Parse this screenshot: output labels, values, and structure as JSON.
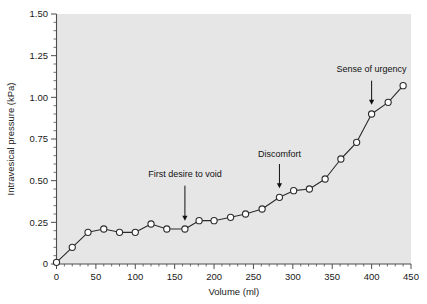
{
  "chart_data": {
    "type": "line",
    "title": "",
    "xlabel": "Volume (ml)",
    "ylabel": "Intravesical pressure (kPa)",
    "xlim": [
      0,
      450
    ],
    "ylim": [
      0,
      1.5
    ],
    "xticks": [
      0,
      50,
      100,
      150,
      200,
      250,
      300,
      350,
      400,
      450
    ],
    "xtick_labels": [
      "0",
      "50",
      "100",
      "150",
      "200",
      "250",
      "300",
      "350",
      "400",
      "450"
    ],
    "yticks": [
      0,
      0.25,
      0.5,
      0.75,
      1.0,
      1.25,
      1.5
    ],
    "ytick_labels": [
      "0",
      "0.25",
      "0.50",
      "0.75",
      "1.00",
      "1.25",
      "1.50"
    ],
    "xtick_minor_step": 10,
    "ytick_minor_step": 0.05,
    "grid": false,
    "legend": false,
    "plot_background": "#e6e6e6",
    "line_color": "#2b2b2b",
    "marker_face_color": "#ffffff",
    "marker_edge_color": "#2b2b2b",
    "series": [
      {
        "name": "Cystometrogram",
        "x": [
          0,
          20,
          40,
          60,
          80,
          100,
          120,
          140,
          163,
          181,
          200,
          221,
          240,
          261,
          283,
          301,
          321,
          341,
          361,
          381,
          400,
          421,
          440
        ],
        "values": [
          0.01,
          0.1,
          0.19,
          0.21,
          0.19,
          0.19,
          0.24,
          0.21,
          0.21,
          0.26,
          0.26,
          0.28,
          0.3,
          0.33,
          0.4,
          0.44,
          0.45,
          0.51,
          0.63,
          0.73,
          0.9,
          0.97,
          1.07
        ]
      }
    ],
    "annotations": [
      {
        "id": "first-desire-to-void",
        "label": "First desire to void",
        "x": 163,
        "y": 0.21,
        "text_x": 163,
        "text_y": 0.52,
        "arrow_from_y": 0.47,
        "arrow_to_y": 0.26
      },
      {
        "id": "discomfort",
        "label": "Discomfort",
        "x": 283,
        "y": 0.4,
        "text_x": 283,
        "text_y": 0.645,
        "arrow_from_y": 0.6,
        "arrow_to_y": 0.455
      },
      {
        "id": "sense-of-urgency",
        "label": "Sense of urgency",
        "x": 400,
        "y": 0.9,
        "text_x": 400,
        "text_y": 1.15,
        "arrow_from_y": 1.1,
        "arrow_to_y": 0.955
      }
    ]
  }
}
